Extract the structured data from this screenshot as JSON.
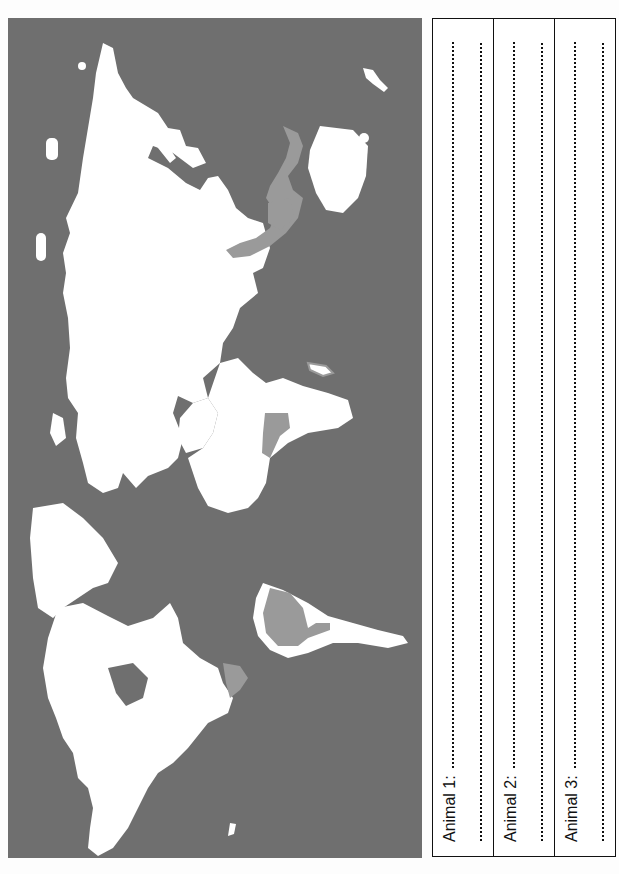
{
  "worksheet": {
    "map": {
      "description": "World map rotated 90 degrees counter-clockwise, with highlighted habitat regions",
      "colors": {
        "ocean": "#6f6f6f",
        "land": "#ffffff",
        "highlight": "#9a9a9a"
      },
      "highlighted_regions": [
        "Maritime Southeast Asia",
        "Central Africa",
        "South America (Amazon)",
        "Central America"
      ]
    },
    "answers": [
      {
        "label": "Animal 1:"
      },
      {
        "label": "Animal 2:"
      },
      {
        "label": "Animal 3:"
      }
    ]
  }
}
